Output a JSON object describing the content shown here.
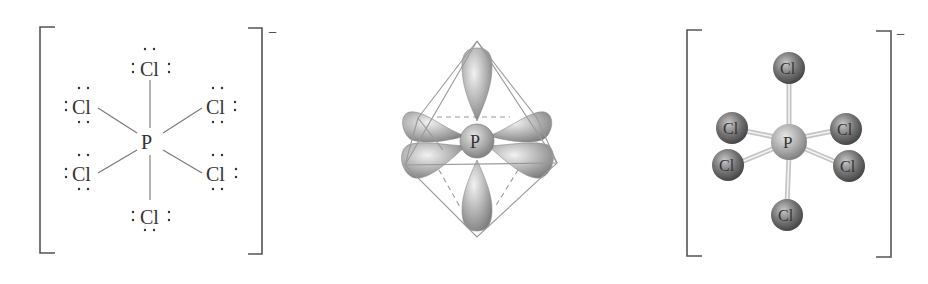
{
  "panels": {
    "lewis": {
      "charge": "−",
      "central": "P",
      "ligands": [
        "Cl",
        "Cl",
        "Cl",
        "Cl",
        "Cl",
        "Cl"
      ],
      "lone_pair_glyph": ":",
      "dots": "• •"
    },
    "orbital": {
      "central": "P",
      "shape": "octahedral sp3d2 hybrid orbitals"
    },
    "ball_stick": {
      "charge": "−",
      "central": "P",
      "ligands": [
        "Cl",
        "Cl",
        "Cl",
        "Cl",
        "Cl",
        "Cl"
      ]
    }
  },
  "colors": {
    "ink": "#333333",
    "bond": "#666666",
    "bracket": "#555555",
    "lobe": "#a8a8a8",
    "atom_cl": "#6f6f6f",
    "atom_p": "#a0a0a0",
    "edge": "#999999"
  }
}
